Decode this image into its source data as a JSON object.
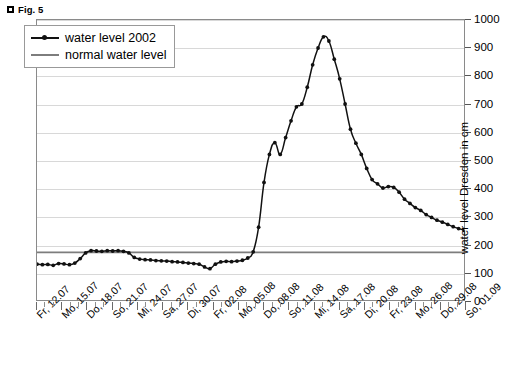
{
  "figure": {
    "bullet_icon": "square-bullet-icon",
    "caption": "Fig. 5"
  },
  "legend": {
    "position": "top-left-inside",
    "entries": [
      {
        "label": "water level 2002",
        "marker": "line-with-dot",
        "color": "#111111"
      },
      {
        "label": "normal water level",
        "marker": "line",
        "color": "#7d7d7d"
      }
    ]
  },
  "chart_data": {
    "type": "line",
    "title": "Fig. 5",
    "xlabel": "",
    "ylabel": "water level Dresden in cm",
    "ylim": [
      0,
      1000
    ],
    "ytick_step": 100,
    "yticks": [
      0,
      100,
      200,
      300,
      400,
      500,
      600,
      700,
      800,
      900,
      1000
    ],
    "grid": true,
    "grid_axis": "y",
    "legend_position": "upper left",
    "x": [
      "Fr, 12.07",
      "Sa, 13.07",
      "So, 14.07",
      "Mo, 15.07",
      "Di, 16.07",
      "Mi, 17.07",
      "Do, 18.07",
      "Fr, 19.07",
      "Sa, 20.07",
      "So, 21.07",
      "Mo, 22.07",
      "Di, 23.07",
      "Mi, 24.07",
      "Do, 25.07",
      "Fr, 26.07",
      "Sa, 27.07",
      "So, 28.07",
      "Mo, 29.07",
      "Di, 30.07",
      "Mi, 31.07",
      "Do, 01.08",
      "Fr, 02.08",
      "Sa, 03.08",
      "So, 04.08",
      "Mo, 05.08",
      "Di, 06.08",
      "Mi, 07.08",
      "Do, 08.08",
      "Fr, 09.08",
      "Sa, 10.08",
      "So, 11.08",
      "Mo, 12.08",
      "Di, 13.08",
      "Mi, 14.08",
      "Do, 15.08",
      "Fr, 16.08",
      "Sa, 17.08",
      "So, 18.08",
      "Mo, 19.08",
      "Di, 20.08",
      "Mi, 21.08",
      "Do, 22.08",
      "Fr, 23.08",
      "Sa, 24.08",
      "So, 25.08",
      "Mo, 26.08",
      "Di, 27.08",
      "Mi, 28.08",
      "Do, 29.08",
      "Fr, 30.08",
      "Sa, 31.08",
      "So, 01.09"
    ],
    "xtick_labels_shown": [
      "Fr, 12.07",
      "Mo, 15.07",
      "Do, 18.07",
      "So, 21.07",
      "Mi, 24.07",
      "Sa, 27.07",
      "Di, 30.07",
      "Fr, 02.08",
      "Mo, 05.08",
      "Do, 08.08",
      "So, 11.08",
      "Mi, 14.08",
      "Sa, 17.08",
      "Di, 20.08",
      "Fr, 23.08",
      "Mo, 26.08",
      "Do, 29.08",
      "So, 01.09"
    ],
    "series": [
      {
        "name": "water level 2002",
        "color": "#111111",
        "marker": "dot",
        "values": [
          128,
          126,
          127,
          124,
          130,
          129,
          126,
          132,
          148,
          168,
          176,
          175,
          174,
          176,
          175,
          176,
          174,
          168,
          152,
          146,
          144,
          143,
          141,
          140,
          139,
          137,
          136,
          134,
          132,
          130,
          128,
          118,
          112,
          128,
          136,
          138,
          137,
          139,
          142,
          150,
          172,
          260,
          420,
          520,
          562,
          520,
          580,
          640,
          690,
          700,
          760,
          840
        ]
      },
      {
        "name": "normal water level",
        "color": "#7d7d7d",
        "type": "hline",
        "value": 170
      }
    ],
    "full_curve_values": [
      128,
      126,
      127,
      124,
      130,
      129,
      126,
      132,
      148,
      168,
      176,
      175,
      174,
      176,
      175,
      176,
      174,
      168,
      152,
      146,
      144,
      143,
      141,
      140,
      139,
      137,
      136,
      134,
      132,
      130,
      128,
      118,
      112,
      128,
      136,
      138,
      137,
      139,
      142,
      150,
      172,
      260,
      420,
      520,
      562,
      520,
      580,
      640,
      690,
      700,
      760,
      840,
      900,
      940,
      925,
      860,
      790,
      700,
      610,
      560,
      520,
      470,
      430,
      415,
      400,
      405,
      402,
      385,
      360,
      345,
      330,
      320,
      305,
      295,
      285,
      278,
      270,
      262,
      255,
      250
    ],
    "annotations": {
      "peak_value": 940,
      "peak_label": "Di, 20.08 region",
      "normal_level": 170,
      "baseline_range": [
        112,
        176
      ]
    }
  },
  "axes": {
    "y_title": "water level Dresden in cm",
    "y_labels": [
      "1000",
      "900",
      "800",
      "700",
      "600",
      "500",
      "400",
      "300",
      "200",
      "100",
      "0"
    ]
  }
}
